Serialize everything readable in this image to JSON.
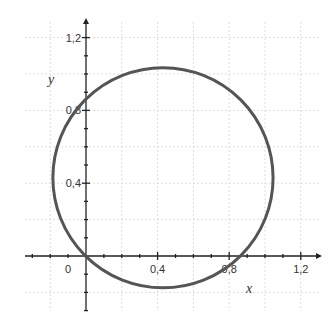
{
  "chart_data": {
    "type": "line",
    "title": "",
    "xlabel": "x",
    "ylabel": "y",
    "xlim": [
      -0.33,
      1.3
    ],
    "ylim": [
      -0.3,
      1.28
    ],
    "x_ticks": [
      0,
      0.4,
      0.8,
      1.2
    ],
    "x_tick_labels": [
      "0",
      "0,4",
      "0,8",
      "1,2"
    ],
    "y_ticks": [
      0.4,
      0.8,
      1.2
    ],
    "y_tick_labels": [
      "0,4",
      "0,8",
      "1,2"
    ],
    "minor_tick_step": 0.1,
    "grid": true,
    "legend": null,
    "series": [
      {
        "name": "circle",
        "shape": "circle",
        "center": [
          0.43,
          0.43
        ],
        "radius": 0.61,
        "intercepts": {
          "origin": [
            0,
            0
          ],
          "x_axis": [
            0.86,
            0
          ],
          "y_axis": [
            0,
            0.86
          ]
        },
        "color": "#555555"
      }
    ]
  },
  "colors": {
    "curve": "#555555",
    "axis": "#222222",
    "grid": "#dddddd"
  }
}
